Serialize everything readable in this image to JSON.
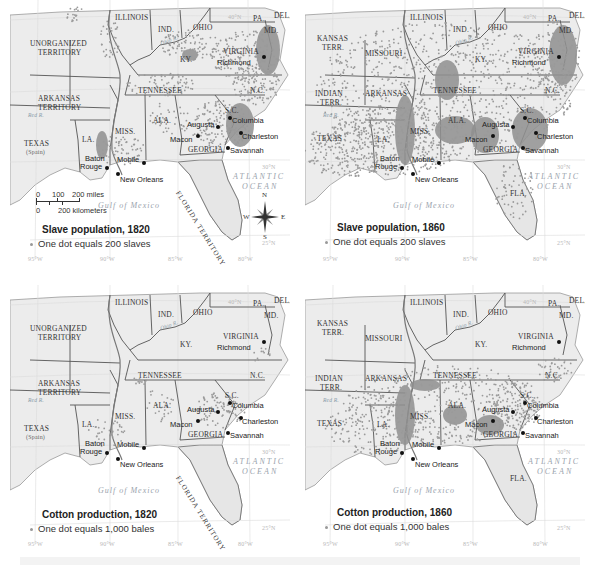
{
  "figure": {
    "panels": [
      {
        "id": "slave-1820",
        "title": "Slave population, 1820",
        "legend": "One dot equals 200 slaves",
        "western_labels": {
          "top": "UNORGANIZED",
          "top2": "TERRITORY",
          "mid": "ARKANSAS",
          "mid2": "TERRITORY",
          "south": "TEXAS",
          "south2": "(Spain)"
        },
        "florida_label": "FLORIDA TERRITORY",
        "show_scale": true,
        "show_compass": true
      },
      {
        "id": "slave-1860",
        "title": "Slave population, 1860",
        "legend": "One dot equals 200 slaves",
        "western_labels": {
          "top": "KANSAS",
          "top2": "TERR.",
          "missouri": "MISSOURI",
          "mid": "INDIAN",
          "mid2": "TERR.",
          "arkansas": "ARKANSAS",
          "south": "TEXAS"
        },
        "florida_label": "FLA.",
        "show_scale": false,
        "show_compass": false
      },
      {
        "id": "cotton-1820",
        "title": "Cotton production, 1820",
        "legend": "One dot equals 1,000 bales",
        "western_labels": {
          "top": "UNORGANIZED",
          "top2": "TERRITORY",
          "mid": "ARKANSAS",
          "mid2": "TERRITORY",
          "south": "TEXAS",
          "south2": "(Spain)"
        },
        "florida_label": "FLORIDA TERRITORY",
        "show_scale": false,
        "show_compass": false
      },
      {
        "id": "cotton-1860",
        "title": "Cotton production, 1860",
        "legend": "One dot equals 1,000 bales",
        "western_labels": {
          "top": "KANSAS",
          "top2": "TERR.",
          "missouri": "MISSOURI",
          "mid": "INDIAN",
          "mid2": "TERR.",
          "arkansas": "ARKANSAS",
          "south": "TEXAS"
        },
        "florida_label": "FLA.",
        "show_scale": false,
        "show_compass": false
      }
    ],
    "states": {
      "illinois": "ILLINOIS",
      "indiana": "IND.",
      "ohio": "OHIO",
      "pennsylvania": "PA.",
      "delaware": "DEL.",
      "maryland": "MD.",
      "virginia": "VIRGINIA",
      "kentucky": "KY.",
      "tennessee": "TENNESSEE",
      "north_carolina": "N.C.",
      "south_carolina": "S.C.",
      "alabama": "ALA.",
      "mississippi": "MISS.",
      "louisiana": "LA.",
      "georgia": "GEORGIA"
    },
    "cities": {
      "richmond": "Richmond",
      "columbia": "Columbia",
      "augusta": "Augusta",
      "charleston": "Charleston",
      "macon": "Macon",
      "savannah": "Savannah",
      "baton_rouge_1": "Baton",
      "baton_rouge_2": "Rouge",
      "mobile": "Mobile",
      "new_orleans": "New Orleans"
    },
    "water": {
      "atlantic_1": "ATLANTIC",
      "atlantic_2": "OCEAN",
      "gulf": "Gulf of Mexico",
      "ohio_river": "Ohio R.",
      "red_river": "Red R."
    },
    "coordinates": {
      "lat_40": "40°N",
      "lat_35": "35°N",
      "lat_30": "30°N",
      "lat_25": "25°N",
      "lon_95": "95°W",
      "lon_90": "90°W",
      "lon_85": "85°W",
      "lon_80": "80°W"
    },
    "scale_bar": {
      "miles_0": "0",
      "miles_100": "100",
      "miles_200": "200 miles",
      "km_0": "0",
      "km_200": "200 kilometers"
    },
    "compass": {
      "n": "N",
      "s": "S",
      "e": "E",
      "w": "W"
    },
    "footer_caption": "MAP ACTIVITY",
    "colors": {
      "land": "#ececec",
      "land_focus": "#e4e4e4",
      "water": "#ffffff",
      "dot": "#9a9a9a",
      "dense": "#8f8f8f",
      "border": "#555555",
      "text": "#222222"
    }
  }
}
